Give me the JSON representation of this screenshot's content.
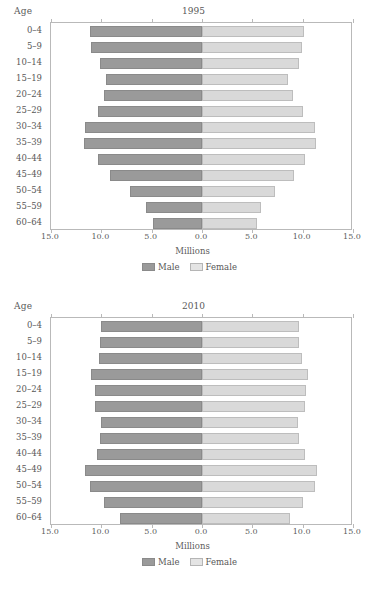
{
  "chart_data": [
    {
      "type": "bar",
      "subtype": "population-pyramid",
      "title": "1995",
      "xlabel": "Millions",
      "ylabel": "Age",
      "xlim": [
        -15.0,
        15.0
      ],
      "xticks": [
        "15.0",
        "10.0",
        "5.0",
        "0.0",
        "5.0",
        "10.0",
        "15.0"
      ],
      "xtick_values": [
        -15,
        -10,
        -5,
        0,
        5,
        10,
        15
      ],
      "grid": false,
      "legend_position": "bottom-center",
      "categories": [
        "0–4",
        "5–9",
        "10–14",
        "15–19",
        "20–24",
        "25–29",
        "30–34",
        "35–39",
        "40–44",
        "45–49",
        "50–54",
        "55–59",
        "60–64"
      ],
      "series": [
        {
          "name": "Male",
          "color": "#9a9a9a",
          "values": [
            11.1,
            11.0,
            10.1,
            9.5,
            9.7,
            10.3,
            11.6,
            11.7,
            10.3,
            9.1,
            7.2,
            5.6,
            4.9
          ]
        },
        {
          "name": "Female",
          "color": "#d9d9d9",
          "values": [
            10.1,
            9.9,
            9.6,
            8.5,
            9.0,
            10.0,
            11.2,
            11.3,
            10.2,
            9.1,
            7.3,
            5.9,
            5.5
          ]
        }
      ]
    },
    {
      "type": "bar",
      "subtype": "population-pyramid",
      "title": "2010",
      "xlabel": "Millions",
      "ylabel": "Age",
      "xlim": [
        -15.0,
        15.0
      ],
      "xticks": [
        "15.0",
        "10.0",
        "5.0",
        "0.0",
        "5.0",
        "10.0",
        "15.0"
      ],
      "xtick_values": [
        -15,
        -10,
        -5,
        0,
        5,
        10,
        15
      ],
      "grid": false,
      "legend_position": "bottom-center",
      "categories": [
        "0–4",
        "5–9",
        "10–14",
        "15–19",
        "20–24",
        "25–29",
        "30–34",
        "35–39",
        "40–44",
        "45–49",
        "50–54",
        "55–59",
        "60–64"
      ],
      "series": [
        {
          "name": "Male",
          "color": "#9a9a9a",
          "values": [
            10.0,
            10.1,
            10.2,
            11.0,
            10.6,
            10.6,
            10.0,
            10.1,
            10.4,
            11.6,
            11.1,
            9.7,
            8.1
          ]
        },
        {
          "name": "Female",
          "color": "#d9d9d9",
          "values": [
            9.6,
            9.6,
            9.9,
            10.5,
            10.3,
            10.2,
            9.5,
            9.6,
            10.2,
            11.4,
            11.2,
            10.0,
            8.7
          ]
        }
      ]
    }
  ],
  "panels": [
    {
      "age_header": "Age",
      "title": "1995",
      "axis_title": "Millions",
      "legend": [
        {
          "label": "Male",
          "swatch": "male-swatch"
        },
        {
          "label": "Female",
          "swatch": "female-swatch"
        }
      ]
    },
    {
      "age_header": "Age",
      "title": "2010",
      "axis_title": "Millions",
      "legend": [
        {
          "label": "Male",
          "swatch": "male-swatch"
        },
        {
          "label": "Female",
          "swatch": "female-swatch"
        }
      ]
    }
  ]
}
